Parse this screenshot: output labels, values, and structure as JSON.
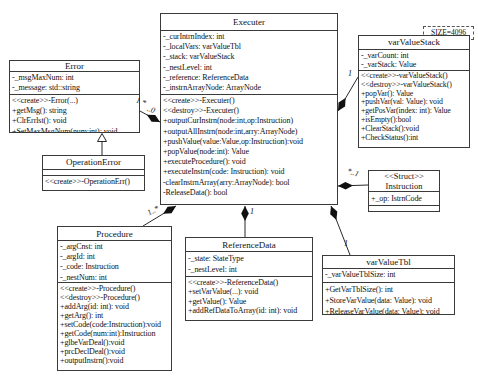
{
  "note": "SIZE=4096",
  "classes": {
    "executer": {
      "title": "Executer",
      "attrs": [
        "-_curIntrnIndex: int",
        "-_localVars: varValueTbl",
        "-_stack: varValueStack",
        "-_nestLevel: int",
        "-_reference: ReferenceData",
        "-_instrnArrayNode: ArrayNode"
      ],
      "methods": [
        "<<create>>-Executer()",
        "<<destroy>>-Executer()",
        "+outputCurInstrn(node:int,op:Instruction)",
        "+outputAllInstrn(node:int,arry:ArrayNode)",
        "+pushValue(value:Value,op:Instruction):void",
        "+popValue(node:int): Value",
        "+executeProcedure(): void",
        "+executeInstrn(code: Instruction): void",
        "-clearInstrnArray(arry:ArrayNode): bool",
        "-ReleaseData(): bool",
        "..."
      ]
    },
    "error": {
      "title": "Error",
      "attrs": [
        "-_msgMaxNum: int",
        "-_message: std::string"
      ],
      "methods": [
        "<<create>>-Error(...)",
        "+getMsg(): string",
        "+ClrErrlst(): void",
        "+SetMaxMsgNum(num:int): void"
      ]
    },
    "operationError": {
      "title": "OperationError",
      "methods": [
        "<<create>>-OperationErr()"
      ]
    },
    "varValueStack": {
      "title": "varValueStack",
      "attrs": [
        "-_varCount: int",
        "-_varStack: Value"
      ],
      "methods": [
        "<<create>>-varValueStack()",
        "<<destroy>>-varValueStack()",
        "+popVar(): Value",
        "+pushVar(val: Value): void",
        "+getPosVar(index: int): Value",
        "+isEmpty():bool",
        "+ClearStack():void",
        "+CheckStatus():int",
        "..."
      ]
    },
    "instruction": {
      "stereotype": "<<Struct>>",
      "title": "Instruction",
      "attrs": [
        "+_op: IstrnCode"
      ]
    },
    "procedure": {
      "title": "Procedure",
      "attrs": [
        "-_argCnst: int",
        "-_argId: int",
        "-_code: Instruction",
        "-_nestNum: int"
      ],
      "methods": [
        "<<create>>-Procedure()",
        "<<destroy>>-Procedure()",
        "+addArg(id: int): void",
        "+getArg(): int",
        "+setCode(code:Instruction):void",
        "+getCode(num:int):Instruction",
        "+glbeVarDeal():void",
        "+prcDeclDeal():void",
        "+outputInstrn():void",
        "..."
      ]
    },
    "referenceData": {
      "title": "ReferenceData",
      "attrs": [
        "-_state: StateType",
        "-_nestLevel: int"
      ],
      "methods": [
        "<<create>>-ReferenceData()",
        "+setVarValue(...): void",
        "+getValue(): Value",
        "+addRefDataToArray(id: int): void",
        "..."
      ]
    },
    "varValueTbl": {
      "title": "varValueTbl",
      "attrs": [
        "-_varValueTblSize: int"
      ],
      "methods": [
        "+GetVarTblSize(): int",
        "+StoreVarValue(data: Value): void",
        "+ReleaseVarValue(data: Value): void"
      ]
    }
  },
  "multiplicities": {
    "error_executer_a": "1 *",
    "error_executer_b": "..0",
    "executer_stack": "1",
    "executer_instruction": "*..1",
    "executer_procedure": "1..*",
    "executer_refdata": "1",
    "executer_tbl": "1"
  }
}
